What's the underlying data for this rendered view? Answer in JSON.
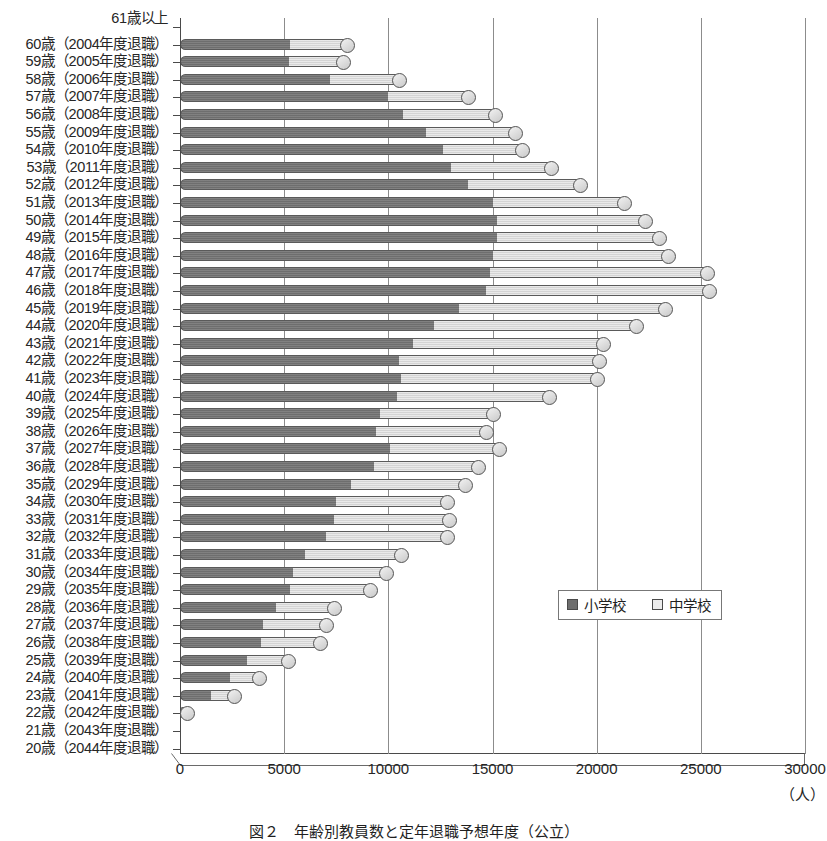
{
  "chart_data": {
    "type": "bar",
    "orientation": "horizontal",
    "stacked": true,
    "title": "",
    "xlabel": "(人)",
    "ylabel": "",
    "xlim": [
      0,
      30000
    ],
    "xticks": [
      0,
      5000,
      10000,
      15000,
      20000,
      25000,
      30000
    ],
    "xtick_labels": [
      "0",
      "5000",
      "10000",
      "15000",
      "20000",
      "25000",
      "30000"
    ],
    "grid": true,
    "legend_position": "inside-right",
    "series": [
      {
        "name": "小学校",
        "color": "#6e6e6e"
      },
      {
        "name": "中学校",
        "color": "#d4d4d4"
      }
    ],
    "categories": [
      "61歳以上",
      "60歳（2004年度退職）",
      "59歳（2005年度退職）",
      "58歳（2006年度退職）",
      "57歳（2007年度退職）",
      "56歳（2008年度退職）",
      "55歳（2009年度退職）",
      "54歳（2010年度退職）",
      "53歳（2011年度退職）",
      "52歳（2012年度退職）",
      "51歳（2013年度退職）",
      "50歳（2014年度退職）",
      "49歳（2015年度退職）",
      "48歳（2016年度退職）",
      "47歳（2017年度退職）",
      "46歳（2018年度退職）",
      "45歳（2019年度退職）",
      "44歳（2020年度退職）",
      "43歳（2021年度退職）",
      "42歳（2022年度退職）",
      "41歳（2023年度退職）",
      "40歳（2024年度退職）",
      "39歳（2025年度退職）",
      "38歳（2026年度退職）",
      "37歳（2027年度退職）",
      "36歳（2028年度退職）",
      "35歳（2029年度退職）",
      "34歳（2030年度退職）",
      "33歳（2031年度退職）",
      "32歳（2032年度退職）",
      "31歳（2033年度退職）",
      "30歳（2034年度退職）",
      "29歳（2035年度退職）",
      "28歳（2036年度退職）",
      "27歳（2037年度退職）",
      "26歳（2038年度退職）",
      "25歳（2039年度退職）",
      "24歳（2040年度退職）",
      "23歳（2041年度退職）",
      "22歳（2042年度退職）",
      "21歳（2043年度退職）",
      "20歳（2044年度退職）"
    ],
    "rows": [
      {
        "label_age": "61歳以上",
        "label_year": "",
        "s1": 0,
        "s2": 0
      },
      {
        "label_age": "60歳",
        "label_year": "（2004年度退職）",
        "s1": 5300,
        "s2": 2700
      },
      {
        "label_age": "59歳",
        "label_year": "（2005年度退職）",
        "s1": 5250,
        "s2": 2550
      },
      {
        "label_age": "58歳",
        "label_year": "（2006年度退職）",
        "s1": 7200,
        "s2": 3300
      },
      {
        "label_age": "57歳",
        "label_year": "（2007年度退職）",
        "s1": 10000,
        "s2": 3800
      },
      {
        "label_age": "56歳",
        "label_year": "（2008年度退職）",
        "s1": 10700,
        "s2": 4400
      },
      {
        "label_age": "55歳",
        "label_year": "（2009年度退職）",
        "s1": 11800,
        "s2": 4300
      },
      {
        "label_age": "54歳",
        "label_year": "（2010年度退職）",
        "s1": 12600,
        "s2": 3800
      },
      {
        "label_age": "53歳",
        "label_year": "（2011年度退職）",
        "s1": 13000,
        "s2": 4800
      },
      {
        "label_age": "52歳",
        "label_year": "（2012年度退職）",
        "s1": 13800,
        "s2": 5400
      },
      {
        "label_age": "51歳",
        "label_year": "（2013年度退職）",
        "s1": 15000,
        "s2": 6300
      },
      {
        "label_age": "50歳",
        "label_year": "（2014年度退職）",
        "s1": 15200,
        "s2": 7100
      },
      {
        "label_age": "49歳",
        "label_year": "（2015年度退職）",
        "s1": 15200,
        "s2": 7800
      },
      {
        "label_age": "48歳",
        "label_year": "（2016年度退職）",
        "s1": 15000,
        "s2": 8400
      },
      {
        "label_age": "47歳",
        "label_year": "（2017年度退職）",
        "s1": 14900,
        "s2": 10400
      },
      {
        "label_age": "46歳",
        "label_year": "（2018年度退職）",
        "s1": 14700,
        "s2": 10700
      },
      {
        "label_age": "45歳",
        "label_year": "（2019年度退職）",
        "s1": 13400,
        "s2": 9900
      },
      {
        "label_age": "44歳",
        "label_year": "（2020年度退職）",
        "s1": 12200,
        "s2": 9700
      },
      {
        "label_age": "43歳",
        "label_year": "（2021年度退職）",
        "s1": 11200,
        "s2": 9100
      },
      {
        "label_age": "42歳",
        "label_year": "（2022年度退職）",
        "s1": 10500,
        "s2": 9600
      },
      {
        "label_age": "41歳",
        "label_year": "（2023年度退職）",
        "s1": 10600,
        "s2": 9400
      },
      {
        "label_age": "40歳",
        "label_year": "（2024年度退職）",
        "s1": 10400,
        "s2": 7300
      },
      {
        "label_age": "39歳",
        "label_year": "（2025年度退職）",
        "s1": 9600,
        "s2": 5400
      },
      {
        "label_age": "38歳",
        "label_year": "（2026年度退職）",
        "s1": 9400,
        "s2": 5300
      },
      {
        "label_age": "37歳",
        "label_year": "（2027年度退職）",
        "s1": 10100,
        "s2": 5200
      },
      {
        "label_age": "36歳",
        "label_year": "（2028年度退職）",
        "s1": 9300,
        "s2": 5000
      },
      {
        "label_age": "35歳",
        "label_year": "（2029年度退職）",
        "s1": 8200,
        "s2": 5500
      },
      {
        "label_age": "34歳",
        "label_year": "（2030年度退職）",
        "s1": 7500,
        "s2": 5300
      },
      {
        "label_age": "33歳",
        "label_year": "（2031年度退職）",
        "s1": 7400,
        "s2": 5500
      },
      {
        "label_age": "32歳",
        "label_year": "（2032年度退職）",
        "s1": 7000,
        "s2": 5800
      },
      {
        "label_age": "31歳",
        "label_year": "（2033年度退職）",
        "s1": 6000,
        "s2": 4600
      },
      {
        "label_age": "30歳",
        "label_year": "（2034年度退職）",
        "s1": 5400,
        "s2": 4500
      },
      {
        "label_age": "29歳",
        "label_year": "（2035年度退職）",
        "s1": 5300,
        "s2": 3800
      },
      {
        "label_age": "28歳",
        "label_year": "（2036年度退職）",
        "s1": 4600,
        "s2": 2800
      },
      {
        "label_age": "27歳",
        "label_year": "（2037年度退職）",
        "s1": 4000,
        "s2": 3000
      },
      {
        "label_age": "26歳",
        "label_year": "（2038年度退職）",
        "s1": 3900,
        "s2": 2800
      },
      {
        "label_age": "25歳",
        "label_year": "（2039年度退職）",
        "s1": 3200,
        "s2": 2000
      },
      {
        "label_age": "24歳",
        "label_year": "（2040年度退職）",
        "s1": 2400,
        "s2": 1400
      },
      {
        "label_age": "23歳",
        "label_year": "（2041年度退職）",
        "s1": 1500,
        "s2": 1100
      },
      {
        "label_age": "22歳",
        "label_year": "（2042年度退職）",
        "s1": 150,
        "s2": 100
      },
      {
        "label_age": "21歳",
        "label_year": "（2043年度退職）",
        "s1": 0,
        "s2": 0
      },
      {
        "label_age": "20歳",
        "label_year": "（2044年度退職）",
        "s1": 0,
        "s2": 0
      }
    ]
  },
  "legend": {
    "item1": "小学校",
    "item2": "中学校"
  },
  "axis": {
    "unit_label": "（人）"
  },
  "caption": {
    "text": "図２　年齢別教員数と定年退職予想年度（公立）"
  },
  "colors": {
    "series1": "#6e6e6e",
    "series2": "#d4d4d4",
    "axis": "#4a4a4a",
    "grid": "#8c8c8c",
    "text": "#262626"
  }
}
